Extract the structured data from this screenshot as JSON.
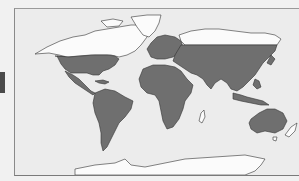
{
  "map": {
    "title": "World distribution map",
    "projection": "world equirectangular-like",
    "legend": {
      "shaded_label": "Range / present",
      "unshaded_label": "Absent"
    },
    "colors": {
      "background": "#f1f1f1",
      "ocean": "#ececec",
      "shaded_land": "#6f6f6f",
      "unshaded_land": "#fbfbfb",
      "outline": "#333333",
      "side_marker": "#4a4a4a"
    },
    "shaded_regions": [
      "Southern North America (USA)",
      "Mexico and Central America",
      "Caribbean",
      "South America",
      "Africa",
      "Europe",
      "Middle East",
      "Central and South Asia",
      "China",
      "Southeast Asia and Indonesia",
      "Australia"
    ],
    "unshaded_regions": [
      "Alaska and Canada",
      "Greenland",
      "Northern Siberia",
      "Antarctica",
      "Madagascar",
      "New Zealand",
      "Tasmania"
    ]
  }
}
